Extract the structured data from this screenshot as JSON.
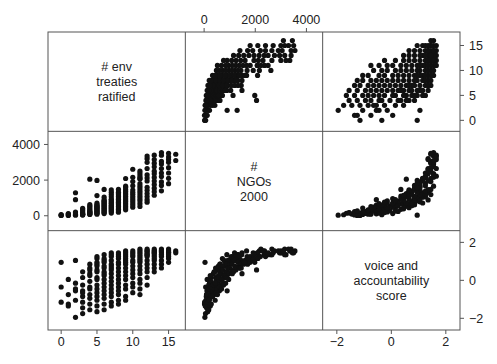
{
  "figure": {
    "kind": "scatterplot-matrix",
    "background": "#ffffff",
    "point_color": "#111111",
    "frame_color": "#555555",
    "n_variables": 3,
    "n_points": 180
  },
  "variables": [
    {
      "key": "treaties",
      "label_lines": [
        "# env",
        "treaties",
        "ratified"
      ],
      "min": -1.0,
      "max": 16.5,
      "ticks": [
        0,
        5,
        10,
        15
      ],
      "tick_labels": [
        "0",
        "5",
        "10",
        "15"
      ],
      "bottom_axis": true,
      "right_axis": true
    },
    {
      "key": "ngos",
      "label_lines": [
        "#",
        "NGOs",
        "2000"
      ],
      "min": -500,
      "max": 4400,
      "ticks": [
        0,
        2000,
        4000
      ],
      "tick_labels": [
        "0",
        "2000",
        "4000"
      ],
      "top_axis": true,
      "left_axis": true
    },
    {
      "key": "voice",
      "label_lines": [
        "voice and",
        "accountability",
        "score"
      ],
      "min": -2.3,
      "max": 2.3,
      "ticks": [
        -2,
        0,
        2
      ],
      "tick_labels": [
        "−2",
        "0",
        "2"
      ],
      "bottom_axis": true,
      "right_axis": true
    }
  ],
  "axes_text": {
    "top": [
      "0",
      "2000",
      "4000"
    ],
    "left": [
      "0",
      "2000",
      "4000"
    ],
    "right_top_row": [
      "0",
      "5",
      "10",
      "15"
    ],
    "right_bottom_row": [
      "−2",
      "0",
      "2"
    ],
    "bottom_left": [
      "0",
      "5",
      "10",
      "15"
    ],
    "bottom_right": [
      "−2",
      "0",
      "2"
    ]
  },
  "chart_data": {
    "type": "scatter",
    "title": "",
    "xlabel": "",
    "ylabel": "",
    "legend": "none",
    "grid": false,
    "matrix_layout": [
      [
        "diag:treaties",
        "ngos_vs_treaties",
        "voice_vs_treaties"
      ],
      [
        "treaties_vs_ngos",
        "diag:ngos",
        "voice_vs_ngos"
      ],
      [
        "treaties_vs_voice",
        "ngos_vs_voice",
        "diag:voice"
      ]
    ],
    "axis_ranges": {
      "treaties": [
        -1.0,
        16.5
      ],
      "ngos": [
        -500,
        4400
      ],
      "voice": [
        -2.3,
        2.3
      ]
    },
    "variable_names": [
      "# env treaties ratified",
      "# NGOs 2000",
      "voice and accountability score"
    ],
    "points": [
      [
        0,
        20,
        -1.15
      ],
      [
        0,
        35,
        0.95
      ],
      [
        0,
        60,
        -0.35
      ],
      [
        1,
        15,
        -1.25
      ],
      [
        1,
        45,
        -1.35
      ],
      [
        1,
        95,
        -0.75
      ],
      [
        1,
        120,
        0.05
      ],
      [
        2,
        30,
        -1.95
      ],
      [
        2,
        70,
        -1.05
      ],
      [
        2,
        150,
        -0.45
      ],
      [
        2,
        1290,
        1.05
      ],
      [
        2,
        210,
        -0.15
      ],
      [
        3,
        40,
        -1.15
      ],
      [
        3,
        85,
        -0.85
      ],
      [
        3,
        110,
        -0.55
      ],
      [
        3,
        180,
        -0.25
      ],
      [
        3,
        260,
        0.15
      ],
      [
        3,
        330,
        -0.65
      ],
      [
        3,
        95,
        -1.45
      ],
      [
        3,
        55,
        -1.75
      ],
      [
        3,
        420,
        0.45
      ],
      [
        4,
        70,
        -1.25
      ],
      [
        4,
        130,
        -0.95
      ],
      [
        4,
        200,
        -0.45
      ],
      [
        4,
        280,
        -0.05
      ],
      [
        4,
        360,
        0.35
      ],
      [
        4,
        450,
        0.65
      ],
      [
        4,
        540,
        -0.35
      ],
      [
        4,
        160,
        -1.55
      ],
      [
        4,
        620,
        0.85
      ],
      [
        4,
        240,
        0.25
      ],
      [
        4,
        100,
        -0.75
      ],
      [
        5,
        85,
        -1.35
      ],
      [
        5,
        175,
        -1.05
      ],
      [
        5,
        265,
        -0.65
      ],
      [
        5,
        355,
        -0.25
      ],
      [
        5,
        445,
        0.15
      ],
      [
        5,
        535,
        0.55
      ],
      [
        5,
        625,
        0.85
      ],
      [
        5,
        715,
        1.15
      ],
      [
        5,
        300,
        -0.85
      ],
      [
        5,
        390,
        0.45
      ],
      [
        5,
        210,
        -0.45
      ],
      [
        5,
        480,
        0.05
      ],
      [
        5,
        140,
        -1.65
      ],
      [
        5,
        560,
        0.75
      ],
      [
        5,
        1130,
        1.25
      ],
      [
        6,
        120,
        -1.25
      ],
      [
        6,
        230,
        -0.95
      ],
      [
        6,
        340,
        -0.55
      ],
      [
        6,
        450,
        -0.15
      ],
      [
        6,
        560,
        0.25
      ],
      [
        6,
        670,
        0.65
      ],
      [
        6,
        780,
        1.05
      ],
      [
        6,
        890,
        1.35
      ],
      [
        6,
        390,
        -0.75
      ],
      [
        6,
        500,
        0.05
      ],
      [
        6,
        610,
        0.45
      ],
      [
        6,
        720,
        0.75
      ],
      [
        6,
        280,
        -0.35
      ],
      [
        6,
        1040,
        1.15
      ],
      [
        6,
        180,
        -1.55
      ],
      [
        6,
        830,
        0.95
      ],
      [
        7,
        150,
        -1.15
      ],
      [
        7,
        280,
        -0.85
      ],
      [
        7,
        410,
        -0.45
      ],
      [
        7,
        540,
        -0.05
      ],
      [
        7,
        670,
        0.35
      ],
      [
        7,
        800,
        0.75
      ],
      [
        7,
        930,
        1.05
      ],
      [
        7,
        1060,
        1.25
      ],
      [
        7,
        460,
        -0.65
      ],
      [
        7,
        590,
        0.15
      ],
      [
        7,
        720,
        0.55
      ],
      [
        7,
        1190,
        1.45
      ],
      [
        7,
        350,
        -0.25
      ],
      [
        7,
        1320,
        1.35
      ],
      [
        7,
        240,
        -1.35
      ],
      [
        7,
        880,
        0.85
      ],
      [
        8,
        200,
        -1.05
      ],
      [
        8,
        360,
        -0.75
      ],
      [
        8,
        520,
        -0.35
      ],
      [
        8,
        680,
        0.05
      ],
      [
        8,
        840,
        0.45
      ],
      [
        8,
        1000,
        0.85
      ],
      [
        8,
        1160,
        1.15
      ],
      [
        8,
        1320,
        1.35
      ],
      [
        8,
        600,
        -0.55
      ],
      [
        8,
        760,
        0.25
      ],
      [
        8,
        920,
        0.65
      ],
      [
        8,
        440,
        -0.15
      ],
      [
        8,
        1480,
        1.45
      ],
      [
        8,
        280,
        -1.25
      ],
      [
        8,
        1080,
        0.95
      ],
      [
        8,
        1240,
        1.25
      ],
      [
        9,
        330,
        -0.85
      ],
      [
        9,
        520,
        -0.45
      ],
      [
        9,
        710,
        0.05
      ],
      [
        9,
        900,
        0.45
      ],
      [
        9,
        1090,
        0.85
      ],
      [
        9,
        1280,
        1.15
      ],
      [
        9,
        1470,
        1.35
      ],
      [
        9,
        1660,
        1.55
      ],
      [
        9,
        620,
        -0.25
      ],
      [
        9,
        810,
        0.25
      ],
      [
        9,
        1000,
        0.65
      ],
      [
        9,
        1190,
        1.05
      ],
      [
        9,
        2090,
        1.45
      ],
      [
        9,
        430,
        -1.05
      ],
      [
        9,
        1380,
        1.25
      ],
      [
        10,
        480,
        -0.65
      ],
      [
        10,
        720,
        -0.15
      ],
      [
        10,
        960,
        0.35
      ],
      [
        10,
        1200,
        0.75
      ],
      [
        10,
        1440,
        1.05
      ],
      [
        10,
        1680,
        1.25
      ],
      [
        10,
        1920,
        1.45
      ],
      [
        10,
        2160,
        1.55
      ],
      [
        10,
        840,
        0.15
      ],
      [
        10,
        1080,
        0.55
      ],
      [
        10,
        2610,
        1.35
      ],
      [
        10,
        600,
        -0.35
      ],
      [
        10,
        1320,
        0.95
      ],
      [
        11,
        680,
        -0.45
      ],
      [
        11,
        960,
        0.05
      ],
      [
        11,
        1240,
        0.55
      ],
      [
        11,
        1520,
        0.95
      ],
      [
        11,
        1800,
        1.25
      ],
      [
        11,
        2080,
        1.45
      ],
      [
        11,
        2360,
        1.55
      ],
      [
        11,
        2080,
        1.15
      ],
      [
        11,
        1100,
        0.35
      ],
      [
        11,
        1380,
        0.75
      ],
      [
        11,
        520,
        -0.75
      ],
      [
        11,
        2220,
        1.65
      ],
      [
        11,
        1660,
        1.05
      ],
      [
        11,
        840,
        -0.15
      ],
      [
        12,
        900,
        0.15
      ],
      [
        12,
        1250,
        0.65
      ],
      [
        12,
        1600,
        1.05
      ],
      [
        12,
        1950,
        1.35
      ],
      [
        12,
        2300,
        1.55
      ],
      [
        12,
        2650,
        1.65
      ],
      [
        12,
        3000,
        1.45
      ],
      [
        12,
        3350,
        1.55
      ],
      [
        12,
        1430,
        0.85
      ],
      [
        12,
        1080,
        0.45
      ],
      [
        12,
        2120,
        1.25
      ],
      [
        12,
        760,
        -0.25
      ],
      [
        12,
        3200,
        1.35
      ],
      [
        13,
        1150,
        0.45
      ],
      [
        13,
        1550,
        0.85
      ],
      [
        13,
        1950,
        1.15
      ],
      [
        13,
        2350,
        1.35
      ],
      [
        13,
        2750,
        1.55
      ],
      [
        13,
        3150,
        1.65
      ],
      [
        13,
        1750,
        1.05
      ],
      [
        13,
        2150,
        1.25
      ],
      [
        13,
        2950,
        1.45
      ],
      [
        13,
        1350,
        0.65
      ],
      [
        13,
        3400,
        1.55
      ],
      [
        14,
        1400,
        0.65
      ],
      [
        14,
        1900,
        1.05
      ],
      [
        14,
        2400,
        1.35
      ],
      [
        14,
        2900,
        1.55
      ],
      [
        14,
        3400,
        1.65
      ],
      [
        14,
        3050,
        1.45
      ],
      [
        14,
        2200,
        1.25
      ],
      [
        14,
        1700,
        0.85
      ],
      [
        14,
        3550,
        1.55
      ],
      [
        14,
        2650,
        1.35
      ],
      [
        15,
        2100,
        1.15
      ],
      [
        15,
        2700,
        1.45
      ],
      [
        15,
        3300,
        1.65
      ],
      [
        15,
        3000,
        1.55
      ],
      [
        15,
        2400,
        1.25
      ],
      [
        15,
        3500,
        1.45
      ],
      [
        15,
        1800,
        0.95
      ],
      [
        15,
        3150,
        1.35
      ],
      [
        16,
        3100,
        1.55
      ],
      [
        16,
        3450,
        1.45
      ],
      [
        4,
        2050,
        0.55
      ],
      [
        5,
        1980,
        0.95
      ],
      [
        2,
        900,
        -0.55
      ],
      [
        6,
        1480,
        0.35
      ],
      [
        9,
        1580,
        0.95
      ],
      [
        11,
        2500,
        1.35
      ],
      [
        13,
        2500,
        1.45
      ],
      [
        7,
        1450,
        0.65
      ]
    ],
    "point_columns": [
      "treaties",
      "ngos",
      "voice"
    ],
    "panels": [
      {
        "row": 0,
        "col": 0,
        "type": "diagonal",
        "variable": "treaties"
      },
      {
        "row": 0,
        "col": 1,
        "type": "scatter",
        "x": "ngos",
        "y": "treaties"
      },
      {
        "row": 0,
        "col": 2,
        "type": "scatter",
        "x": "voice",
        "y": "treaties"
      },
      {
        "row": 1,
        "col": 0,
        "type": "scatter",
        "x": "treaties",
        "y": "ngos"
      },
      {
        "row": 1,
        "col": 1,
        "type": "diagonal",
        "variable": "ngos"
      },
      {
        "row": 1,
        "col": 2,
        "type": "scatter",
        "x": "voice",
        "y": "ngos"
      },
      {
        "row": 2,
        "col": 0,
        "type": "scatter",
        "x": "treaties",
        "y": "voice"
      },
      {
        "row": 2,
        "col": 1,
        "type": "scatter",
        "x": "ngos",
        "y": "voice"
      },
      {
        "row": 2,
        "col": 2,
        "type": "diagonal",
        "variable": "voice"
      }
    ]
  }
}
